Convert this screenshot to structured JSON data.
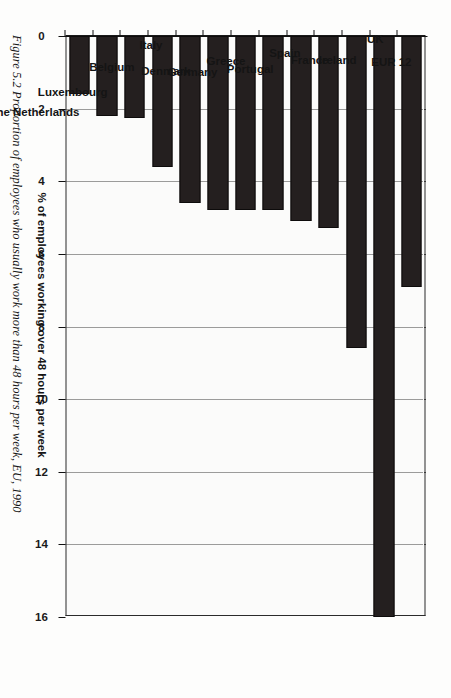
{
  "figure": {
    "caption": "Figure 5.2  Proportion of employees who usually work more than 48 hours per week, EU, 1990",
    "caption_label": "Figure 5.2",
    "caption_text": "Proportion of employees who usually work more than 48 hours per week, EU, 1990"
  },
  "chart_data": {
    "type": "bar",
    "orientation": "vertical",
    "title": "",
    "xlabel": "",
    "ylabel": "% of employees working over 48 hours per week",
    "ylim": [
      0,
      16
    ],
    "yticks": [
      0,
      2,
      4,
      6,
      8,
      10,
      12,
      14,
      16
    ],
    "ytick_labels": [
      "0",
      "2",
      "4",
      "6",
      "8",
      "10",
      "12",
      "14",
      "16"
    ],
    "grid": true,
    "grid_style": "dotted",
    "legend": null,
    "bar_color": "#241f1f",
    "categories": [
      "EUR 12",
      "UK",
      "Ireland",
      "France",
      "Spain",
      "Portugal",
      "Greece",
      "Germany",
      "Denmark",
      "Italy",
      "Belgium",
      "Luxembourg",
      "The Netherlands"
    ],
    "values": [
      6.9,
      16.0,
      8.6,
      5.3,
      5.1,
      4.8,
      4.8,
      4.8,
      4.6,
      3.6,
      2.25,
      2.2,
      1.6
    ]
  }
}
